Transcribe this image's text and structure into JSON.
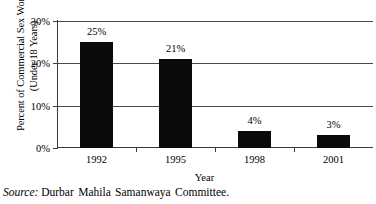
{
  "chart_data": {
    "type": "bar",
    "title": "",
    "subtitle": "",
    "xlabel": "Year",
    "ylabel_line1": "Percent of Commercial Sex Workers",
    "ylabel_line2": "(Under 18 Years)",
    "categories": [
      "1992",
      "1995",
      "1998",
      "2001"
    ],
    "values": [
      25,
      21,
      4,
      3
    ],
    "value_labels": [
      "25%",
      "21%",
      "4%",
      "3%"
    ],
    "ylim": [
      0,
      30
    ],
    "yticks": [
      0,
      10,
      20,
      30
    ],
    "ytick_labels": [
      "0%",
      "10%",
      "20%",
      "30%"
    ],
    "grid": "horizontal",
    "legend": "none",
    "series_color": "#0a0a0a",
    "axis_color": "#3b3b3b",
    "background_color": "#ffffff"
  },
  "source": {
    "label": "Source:",
    "text": "Durbar Mahila Samanwaya Committee."
  }
}
